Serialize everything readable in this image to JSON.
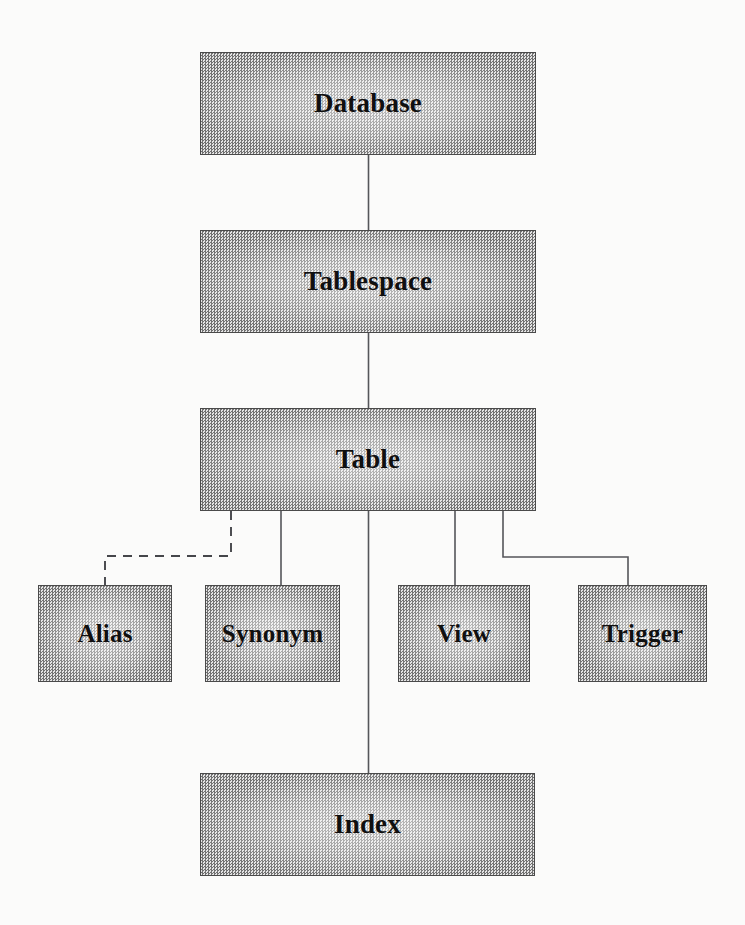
{
  "diagram": {
    "background_color": "#fbfbfa",
    "box_fill_color": "#b9b9b9",
    "box_border_color": "#4a4a4a",
    "line_color": "#55565a",
    "nodes": [
      {
        "id": "database",
        "label": "Database",
        "x": 200,
        "y": 52,
        "w": 336,
        "h": 103,
        "size": "lg"
      },
      {
        "id": "tablespace",
        "label": "Tablespace",
        "x": 200,
        "y": 230,
        "w": 336,
        "h": 103,
        "size": "lg"
      },
      {
        "id": "table",
        "label": "Table",
        "x": 200,
        "y": 408,
        "w": 336,
        "h": 103,
        "size": "lg"
      },
      {
        "id": "alias",
        "label": "Alias",
        "x": 38,
        "y": 585,
        "w": 134,
        "h": 97,
        "size": "sm"
      },
      {
        "id": "synonym",
        "label": "Synonym",
        "x": 205,
        "y": 585,
        "w": 135,
        "h": 97,
        "size": "sm"
      },
      {
        "id": "view",
        "label": "View",
        "x": 398,
        "y": 585,
        "w": 132,
        "h": 97,
        "size": "sm"
      },
      {
        "id": "trigger",
        "label": "Trigger",
        "x": 578,
        "y": 585,
        "w": 129,
        "h": 97,
        "size": "sm"
      },
      {
        "id": "index",
        "label": "Index",
        "x": 200,
        "y": 773,
        "w": 335,
        "h": 103,
        "size": "lg"
      }
    ],
    "edges": [
      {
        "id": "database-to-tablespace",
        "from": "database",
        "to": "tablespace",
        "style": "solid",
        "shape": "straight"
      },
      {
        "id": "tablespace-to-table",
        "from": "tablespace",
        "to": "table",
        "style": "solid",
        "shape": "straight"
      },
      {
        "id": "table-to-alias",
        "from": "table",
        "to": "alias",
        "style": "dashed",
        "shape": "elbow"
      },
      {
        "id": "table-to-synonym",
        "from": "table",
        "to": "synonym",
        "style": "solid",
        "shape": "straight"
      },
      {
        "id": "table-to-view",
        "from": "table",
        "to": "view",
        "style": "solid",
        "shape": "straight"
      },
      {
        "id": "table-to-trigger",
        "from": "table",
        "to": "trigger",
        "style": "solid",
        "shape": "elbow"
      },
      {
        "id": "table-to-index",
        "from": "table",
        "to": "index",
        "style": "solid",
        "shape": "straight"
      }
    ]
  }
}
